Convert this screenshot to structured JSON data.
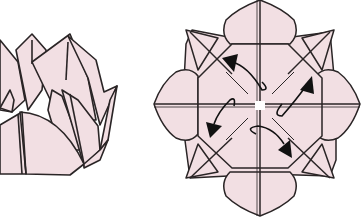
{
  "figure": {
    "colors": {
      "paper_fill": "#f2dfe3",
      "outline": "#2a2526",
      "background": "#ffffff"
    },
    "panels": [
      {
        "id": "lotus-side-view",
        "label": ""
      },
      {
        "id": "lotus-top-view",
        "label": "",
        "arrow_count": 4
      }
    ]
  }
}
